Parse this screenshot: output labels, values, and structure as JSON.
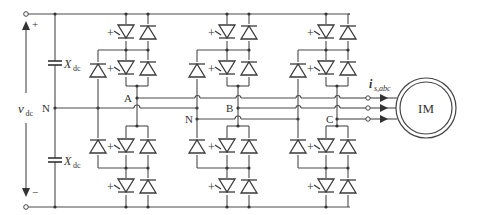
{
  "diagram": {
    "type": "circuit-schematic",
    "dc_link": {
      "voltage_label": "v",
      "voltage_subscript": "dc",
      "plus_label": "+",
      "minus_label": "−",
      "neutral_label": "N",
      "capacitors": [
        {
          "label": "X",
          "subscript": "dc",
          "position": "upper"
        },
        {
          "label": "X",
          "subscript": "dc",
          "position": "lower"
        }
      ]
    },
    "legs": [
      {
        "phase_label": "A",
        "neutral_label": ""
      },
      {
        "phase_label": "B",
        "neutral_label": "N"
      },
      {
        "phase_label": "C",
        "neutral_label": ""
      }
    ],
    "switch_gate_sign": "+",
    "output": {
      "current_label": "i",
      "current_subscript": "s,abc",
      "motor_label": "IM"
    },
    "colors": {
      "wire": "#4a4a4a",
      "background": "#ffffff"
    }
  }
}
